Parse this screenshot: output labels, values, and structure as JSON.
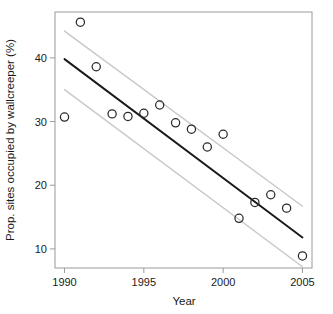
{
  "chart_data": {
    "type": "scatter",
    "title": "",
    "subtitle": "",
    "xlabel": "Year",
    "ylabel": "Prop. sites occupied by wallcreeper (%)",
    "xlim": [
      1989.4,
      2005.6
    ],
    "ylim": [
      7.0,
      47.2
    ],
    "xticks": [
      1990,
      1995,
      2000,
      2005
    ],
    "xtick_labels": [
      "1990",
      "1995",
      "2000",
      "2005"
    ],
    "yticks": [
      10,
      20,
      30,
      40
    ],
    "ytick_labels": [
      "10",
      "20",
      "30",
      "40"
    ],
    "grid": false,
    "legend": null,
    "marker": "open-circle",
    "x": [
      1990,
      1991,
      1992,
      1993,
      1994,
      1995,
      1996,
      1997,
      1998,
      1999,
      2000,
      2001,
      2002,
      2003,
      2004,
      2005
    ],
    "y": [
      30.7,
      45.6,
      38.6,
      31.2,
      30.8,
      31.3,
      32.6,
      29.8,
      28.8,
      26.0,
      28.0,
      14.8,
      17.3,
      18.5,
      16.4,
      8.9
    ],
    "series": [
      {
        "name": "Observed proportion of sites occupied",
        "type": "scatter",
        "marker": "open-circle",
        "color": "#2a2a2a",
        "values": [
          30.7,
          45.6,
          38.6,
          31.2,
          30.8,
          31.3,
          32.6,
          29.8,
          28.8,
          26.0,
          28.0,
          14.8,
          17.3,
          18.5,
          16.4,
          8.9
        ]
      },
      {
        "name": "Fitted linear trend",
        "type": "line",
        "color": "#1a1a1a",
        "x": [
          1990,
          2005
        ],
        "values": [
          39.8,
          11.8
        ]
      },
      {
        "name": "Upper 95% confidence limit",
        "type": "line",
        "color": "#c9c9c9",
        "x": [
          1990,
          2005
        ],
        "values": [
          44.2,
          16.7
        ]
      },
      {
        "name": "Lower 95% confidence limit",
        "type": "line",
        "color": "#c9c9c9",
        "x": [
          1990,
          2005
        ],
        "values": [
          35.0,
          7.2
        ]
      }
    ],
    "annotations": []
  },
  "colors": {
    "background": "#ffffff",
    "axis": "#9a9a9a",
    "text": "#1a1a1a",
    "trend": "#1a1a1a",
    "confidence_band": "#c9c9c9",
    "marker": "#2a2a2a"
  }
}
